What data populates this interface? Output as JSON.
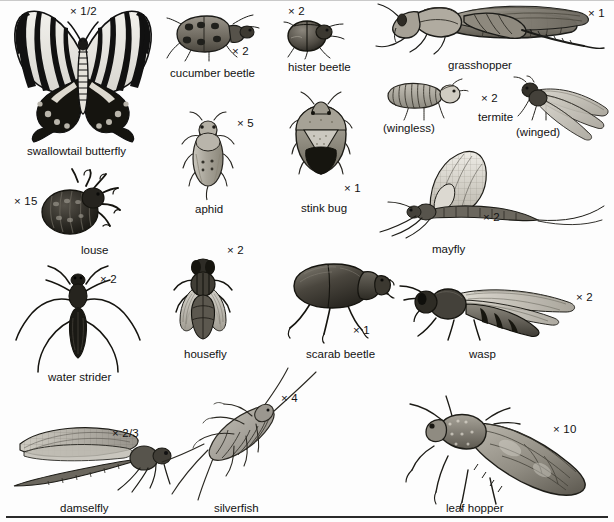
{
  "plate": {
    "title": "Insect identification plate",
    "background_color": "#fdfdfd",
    "ink_color": "#121212",
    "width": 614,
    "height": 522,
    "bottom_rule": true
  },
  "figures": [
    {
      "id": "swallowtail-butterfly",
      "label": "swallowtail butterfly",
      "magnification": "× 1/2",
      "label_x": 27,
      "label_y": 146,
      "mag_x": 70,
      "mag_y": 6,
      "art_x": 8,
      "art_y": 8,
      "art_w": 150,
      "art_h": 135
    },
    {
      "id": "cucumber-beetle",
      "label": "cucumber beetle",
      "magnification": "× 2",
      "label_x": 170,
      "label_y": 68,
      "mag_x": 232,
      "mag_y": 46,
      "art_x": 165,
      "art_y": 8,
      "art_w": 95,
      "art_h": 55
    },
    {
      "id": "hister-beetle",
      "label": "hister beetle",
      "magnification": "× 2",
      "label_x": 288,
      "label_y": 62,
      "mag_x": 288,
      "mag_y": 6,
      "art_x": 282,
      "art_y": 15,
      "art_w": 62,
      "art_h": 42
    },
    {
      "id": "grasshopper",
      "label": "grasshopper",
      "magnification": "× 1",
      "label_x": 448,
      "label_y": 60,
      "mag_x": 588,
      "mag_y": 8,
      "art_x": 378,
      "art_y": 2,
      "art_w": 225,
      "art_h": 55
    },
    {
      "id": "aphid",
      "label": "aphid",
      "magnification": "× 5",
      "label_x": 195,
      "label_y": 204,
      "mag_x": 237,
      "mag_y": 118,
      "art_x": 178,
      "art_y": 113,
      "art_w": 58,
      "art_h": 86
    },
    {
      "id": "stink-bug",
      "label": "stink bug",
      "magnification": "× 1",
      "label_x": 301,
      "label_y": 203,
      "mag_x": 344,
      "mag_y": 183,
      "art_x": 290,
      "art_y": 98,
      "art_w": 62,
      "art_h": 80
    },
    {
      "id": "termite",
      "label": "termite",
      "magnification": "× 2",
      "sublabel_wingless": "(wingless)",
      "sublabel_winged": "(winged)",
      "label_x": 478,
      "label_y": 112,
      "mag_x": 481,
      "mag_y": 93,
      "wingless_x": 383,
      "wingless_y": 123,
      "winged_x": 516,
      "winged_y": 127,
      "art_x": 383,
      "art_y": 78,
      "art_w": 80,
      "art_h": 40
    },
    {
      "id": "louse",
      "label": "louse",
      "magnification": "× 15",
      "label_x": 81,
      "label_y": 245,
      "mag_x": 14,
      "mag_y": 196,
      "art_x": 37,
      "art_y": 172,
      "art_w": 82,
      "art_h": 68
    },
    {
      "id": "mayfly",
      "label": "mayfly",
      "magnification": "× 2",
      "label_x": 432,
      "label_y": 244,
      "mag_x": 483,
      "mag_y": 212,
      "art_x": 372,
      "art_y": 150,
      "art_w": 230,
      "art_h": 90
    },
    {
      "id": "water-strider",
      "label": "water strider",
      "magnification": "× 2",
      "label_x": 48,
      "label_y": 372,
      "mag_x": 100,
      "mag_y": 274,
      "art_x": 12,
      "art_y": 266,
      "art_w": 130,
      "art_h": 110
    },
    {
      "id": "housefly",
      "label": "housefly",
      "magnification": "× 2",
      "label_x": 184,
      "label_y": 349,
      "mag_x": 227,
      "mag_y": 245,
      "art_x": 175,
      "art_y": 258,
      "art_w": 56,
      "art_h": 85
    },
    {
      "id": "scarab-beetle",
      "label": "scarab beetle",
      "magnification": "× 1",
      "label_x": 306,
      "label_y": 349,
      "mag_x": 353,
      "mag_y": 325,
      "art_x": 286,
      "art_y": 262,
      "art_w": 105,
      "art_h": 78
    },
    {
      "id": "wasp",
      "label": "wasp",
      "magnification": "× 2",
      "label_x": 469,
      "label_y": 349,
      "mag_x": 576,
      "mag_y": 292,
      "art_x": 402,
      "art_y": 282,
      "art_w": 190,
      "art_h": 60
    },
    {
      "id": "damselfly",
      "label": "damselfly",
      "magnification": "× 2/3",
      "label_x": 60,
      "label_y": 503,
      "mag_x": 112,
      "mag_y": 428,
      "art_x": 10,
      "art_y": 418,
      "art_w": 160,
      "art_h": 80
    },
    {
      "id": "silverfish",
      "label": "silverfish",
      "magnification": "× 4",
      "label_x": 214,
      "label_y": 503,
      "mag_x": 281,
      "mag_y": 393,
      "art_x": 165,
      "art_y": 370,
      "art_w": 145,
      "art_h": 125
    },
    {
      "id": "leaf-hopper",
      "label": "leaf hopper",
      "magnification": "× 10",
      "label_x": 446,
      "label_y": 503,
      "mag_x": 553,
      "mag_y": 424,
      "art_x": 398,
      "art_y": 398,
      "art_w": 205,
      "art_h": 105
    }
  ]
}
